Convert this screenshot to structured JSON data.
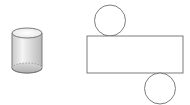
{
  "figure": {
    "colors": {
      "stroke": "#6e6e6e",
      "fill_light": "#f2f2f2",
      "fill_dark": "#bdbdbd",
      "background": "#ffffff"
    },
    "cylinder": {
      "cx": 27,
      "top_y": 33,
      "bottom_y": 68,
      "rx": 15,
      "ry": 5
    },
    "net": {
      "top_circle": {
        "cx": 110,
        "cy": 20,
        "r": 15
      },
      "rectangle": {
        "x": 87,
        "y": 36,
        "width": 96,
        "height": 37
      },
      "bottom_circle": {
        "cx": 160,
        "cy": 89,
        "r": 15
      }
    }
  }
}
